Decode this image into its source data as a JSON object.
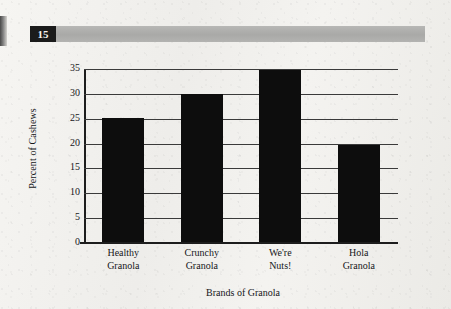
{
  "header": {
    "chapter_number": "15"
  },
  "chart_data": {
    "type": "bar",
    "title": "",
    "xlabel": "Brands of Granola",
    "ylabel": "Percent of Cashews",
    "categories": [
      "Healthy Granola",
      "Crunchy Granola",
      "We're Nuts!",
      "Hola Granola"
    ],
    "category_lines": [
      [
        "Healthy",
        "Granola"
      ],
      [
        "Crunchy",
        "Granola"
      ],
      [
        "We're",
        "Nuts!"
      ],
      [
        "Hola",
        "Granola"
      ]
    ],
    "values": [
      25,
      29.7,
      34.7,
      19.6
    ],
    "ylim": [
      0,
      35
    ],
    "yticks": [
      0,
      5,
      10,
      15,
      20,
      25,
      30,
      35
    ],
    "ytick_labels": [
      "0",
      "5",
      "10",
      "15",
      "20",
      "25",
      "30",
      "35"
    ],
    "grid": true,
    "legend": false,
    "bar_color": "#0d0d0d"
  }
}
